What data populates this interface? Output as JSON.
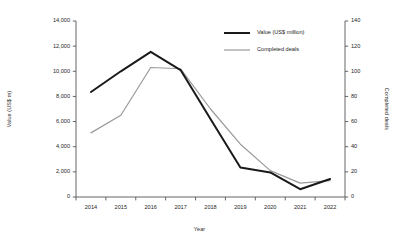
{
  "chart_data": {
    "type": "line",
    "title": "",
    "subtitle": "",
    "xlabel": "Year",
    "ylabel": "Value (US$ m)",
    "y2label": "Completed deals",
    "categories": [
      "2014",
      "2015",
      "2016",
      "2017",
      "2018",
      "2019",
      "2020",
      "2021",
      "2022"
    ],
    "ylim": [
      0,
      14000
    ],
    "y2lim": [
      0,
      140
    ],
    "yticks": [
      "0",
      "2,000",
      "4,000",
      "6,000",
      "8,000",
      "10,000",
      "12,000",
      "14,000"
    ],
    "ytick_values": [
      0,
      2000,
      4000,
      6000,
      8000,
      10000,
      12000,
      14000
    ],
    "y2ticks": [
      "0",
      "20",
      "40",
      "60",
      "80",
      "100",
      "120",
      "140"
    ],
    "y2tick_values": [
      0,
      20,
      40,
      60,
      80,
      100,
      120,
      140
    ],
    "grid": false,
    "legend_position": "top-right",
    "series": [
      {
        "name": "Value (US$ million)",
        "axis": "left",
        "color": "#1a1a1a",
        "width": 2.0,
        "values": [
          8350,
          10000,
          11550,
          10100,
          6200,
          2350,
          1950,
          620,
          1430
        ]
      },
      {
        "name": "Completed deals",
        "axis": "right",
        "color": "#9a9a9a",
        "width": 1.2,
        "values": [
          51,
          65,
          103,
          102,
          70,
          42,
          21,
          11,
          13
        ]
      }
    ]
  },
  "legend": {
    "items": [
      {
        "label": "Value (US$ million)"
      },
      {
        "label": "Completed deals"
      }
    ]
  },
  "colors": {
    "series_value": "#1a1a1a",
    "series_deals": "#9a9a9a",
    "axis": "#555555",
    "text": "#1a1a1a",
    "background": "#ffffff"
  }
}
